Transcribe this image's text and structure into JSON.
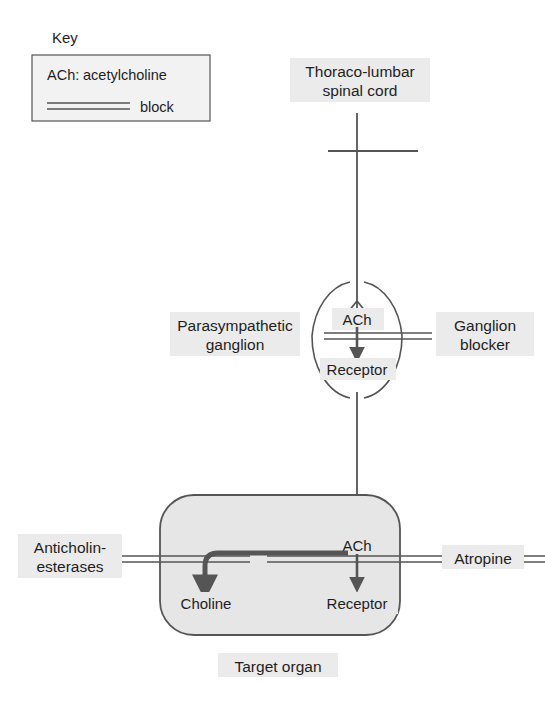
{
  "figure": {
    "background_color": "#ffffff",
    "line_color": "#555555",
    "text_color": "#1e1e1e",
    "organ_fill_color": "#e6e6e6",
    "label_halo_color": "#ebebeb"
  },
  "key": {
    "title": "Key",
    "entries": [
      {
        "symbol": "ACh:",
        "label": "acetylcholine"
      },
      {
        "symbol": "block-lines",
        "label": "block"
      }
    ]
  },
  "nodes": {
    "spinal_cord": "Thoraco-lumbar\nspinal cord",
    "spinal_cord_line1": "Thoraco-lumbar",
    "spinal_cord_line2": "spinal cord",
    "ganglion_label_line1": "Parasympathetic",
    "ganglion_label_line2": "ganglion",
    "ganglion_transmitter": "ACh",
    "ganglion_receptor": "Receptor",
    "ganglion_blocker_line1": "Ganglion",
    "ganglion_blocker_line2": "blocker",
    "organ_transmitter": "ACh",
    "organ_receptor": "Receptor",
    "organ_metabolite": "Choline",
    "organ_caption": "Target organ",
    "anticholinesterases_line1": "Anticholin-",
    "anticholinesterases_line2": "esterases",
    "atropine": "Atropine"
  },
  "blocks": [
    {
      "name": "ganglion-block",
      "drug": "Ganglion blocker",
      "target": "ACh receptor in ganglion"
    },
    {
      "name": "anticholinesterase-block",
      "drug": "Anticholinesterases",
      "target": "ACh breakdown to choline"
    },
    {
      "name": "atropine-block",
      "drug": "Atropine",
      "target": "ACh receptor in target organ"
    }
  ]
}
